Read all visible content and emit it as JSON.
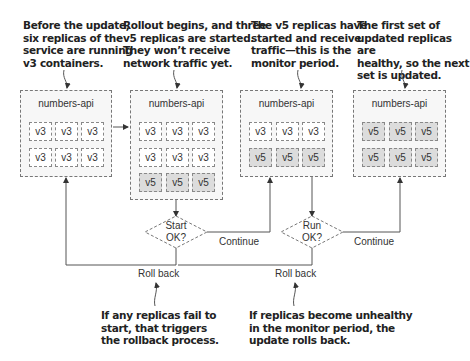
{
  "notes": {
    "before": [
      "Before the update,",
      "six replicas of the",
      "service are running",
      "v3 containers."
    ],
    "rollout": [
      "Rollout begins, and three",
      "v5 replicas are started.",
      "They won’t receive",
      "network traffic yet."
    ],
    "monitor": [
      "The v5 replicas have",
      "started and receive",
      "traffic—this is the",
      "monitor period."
    ],
    "next": [
      "The first set of",
      "updated replicas are",
      "healthy, so the next",
      "set is updated."
    ],
    "fail_start": [
      "If any replicas fail to",
      "start, that triggers",
      "the rollback process."
    ],
    "unhealthy": [
      "If replicas become unhealthy",
      "in the monitor period, the",
      "update rolls back."
    ]
  },
  "services": [
    {
      "title": "numbers-api",
      "rows": [
        [
          "v3",
          "v3",
          "v3"
        ],
        [
          "v3",
          "v3",
          "v3"
        ]
      ]
    },
    {
      "title": "numbers-api",
      "rows": [
        [
          "v3",
          "v3",
          "v3"
        ],
        [
          "v3",
          "v3",
          "v3"
        ],
        [
          "v5",
          "v5",
          "v5"
        ]
      ]
    },
    {
      "title": "numbers-api",
      "rows": [
        [
          "v3",
          "v3",
          "v3"
        ],
        [
          "v5",
          "v5",
          "v5"
        ]
      ]
    },
    {
      "title": "numbers-api",
      "rows": [
        [
          "v5",
          "v5",
          "v5"
        ],
        [
          "v5",
          "v5",
          "v5"
        ]
      ]
    }
  ],
  "decisions": {
    "start": [
      "Start",
      "OK?"
    ],
    "run": [
      "Run",
      "OK?"
    ]
  },
  "labels": {
    "continue_1": "Continue",
    "continue_2": "Continue",
    "rollback_1": "Roll back",
    "rollback_2": "Roll back"
  },
  "colors": {
    "v3_fill": "#ffffff",
    "v5_fill": "#dcdcdc",
    "box_fill": "#f7f7f7",
    "line": "#666666"
  }
}
